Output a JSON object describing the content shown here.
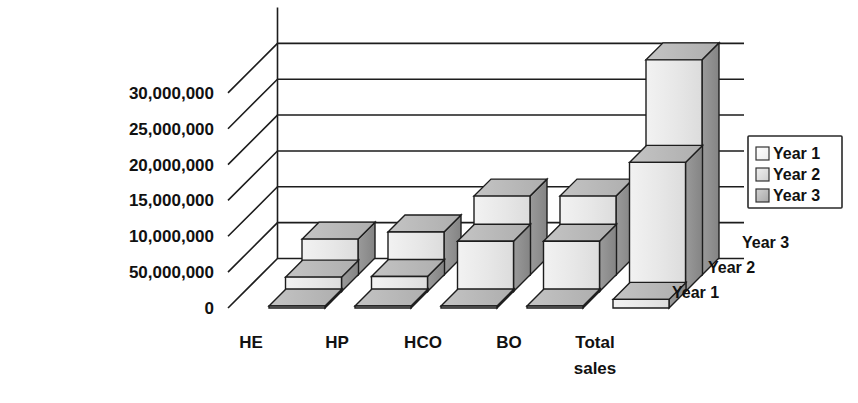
{
  "chart_data": {
    "type": "bar",
    "subtype": "3d-grouped-column",
    "title": "",
    "xlabel": "",
    "ylabel": "",
    "zlabel": "",
    "categories": [
      "HE",
      "HP",
      "HCO",
      "BO",
      "Total sales"
    ],
    "category_labels_wrapped": [
      [
        "HE"
      ],
      [
        "HP"
      ],
      [
        "HCO"
      ],
      [
        "BO"
      ],
      [
        "Total",
        "sales"
      ]
    ],
    "series": [
      {
        "name": "Year 1",
        "values": [
          150000,
          150000,
          200000,
          200000,
          1200000
        ]
      },
      {
        "name": "Year 2",
        "values": [
          2000000,
          2100000,
          7000000,
          7000000,
          18000000
        ]
      },
      {
        "name": "Year 3",
        "values": [
          5000000,
          6000000,
          11000000,
          11000000,
          30000000
        ]
      }
    ],
    "ytick_labels": [
      "30,000,000",
      "25,000,000",
      "20,000,000",
      "15,000,000",
      "10,000,000",
      "50,000,000",
      "0"
    ],
    "ytick_values": [
      30000000,
      25000000,
      20000000,
      15000000,
      10000000,
      5000000,
      0
    ],
    "ylim": [
      0,
      35000000
    ],
    "gridlines": 7,
    "grid": true,
    "legend": {
      "position": "right",
      "entries": [
        "Year 1",
        "Year 2",
        "Year 3"
      ]
    },
    "depth_axis_labels": [
      "Year 3",
      "Year 2",
      "Year 1"
    ],
    "colors": {
      "front_face": "#e9e9e9",
      "top_face": "#b9b9b9",
      "side_face": "#8e8e8e",
      "outline": "#1d1d1d",
      "background": "#ffffff",
      "legend_swatch_year1": "#f2f2f2",
      "legend_swatch_year2": "#d8d8d8",
      "legend_swatch_year3": "#b4b4b4"
    }
  }
}
